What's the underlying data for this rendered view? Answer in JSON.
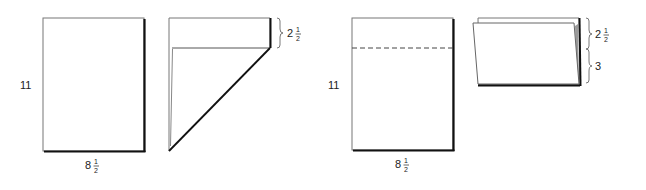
{
  "figures": [
    {
      "id": "flat-sheet",
      "height_label": "11",
      "width_label_whole": "8",
      "width_label_num": "1",
      "width_label_den": "2"
    },
    {
      "id": "diagonal-fold",
      "fold_label_whole": "2",
      "fold_label_num": "1",
      "fold_label_den": "2"
    },
    {
      "id": "sheet-with-dashed-fold-line",
      "height_label": "11",
      "width_label_whole": "8",
      "width_label_num": "1",
      "width_label_den": "2"
    },
    {
      "id": "folded-sheet",
      "top_label_whole": "2",
      "top_label_num": "1",
      "top_label_den": "2",
      "bottom_label": "3"
    }
  ],
  "colors": {
    "line": "#222222",
    "thin_line": "#777777",
    "shadow": "#111111"
  }
}
